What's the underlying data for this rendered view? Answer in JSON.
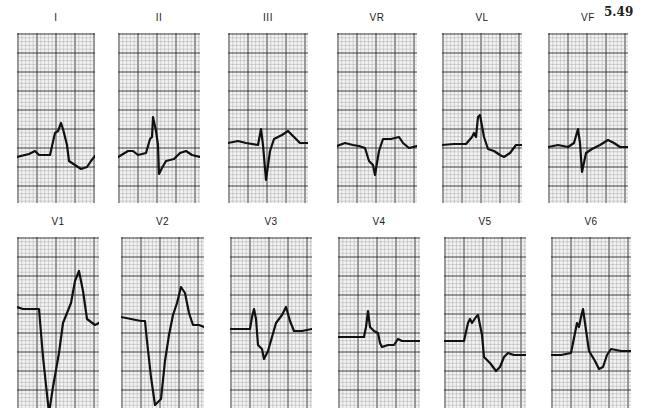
{
  "figure_number": "5.49",
  "grid": {
    "paper_color": "#f3f3f3",
    "minor_color": "#9a9a9a",
    "major_color": "#2a2a2a",
    "trace_color": "#111111"
  },
  "leads": [
    {
      "label": "I",
      "x": 17,
      "y": 12,
      "w": 78,
      "h": 170,
      "path": "M0,124 L12,121 L18,118 L22,122 L33,122 L38,100 L41,98 L44,90 L46,96 L50,112 L52,128 L58,132 L64,136 L70,134 L74,128 L78,123"
    },
    {
      "label": "II",
      "x": 118,
      "y": 12,
      "w": 82,
      "h": 170,
      "path": "M0,124 L10,118 L15,118 L20,122 L28,120 L32,106 L34,104 L35,84 L38,98 L40,112 L41,141 L44,135 L48,128 L56,126 L62,120 L68,118 L74,122 L82,124"
    },
    {
      "label": "III",
      "x": 228,
      "y": 12,
      "w": 80,
      "h": 170,
      "path": "M0,110 L10,108 L18,110 L30,112 L33,96 L35,112 L38,147 L42,118 L46,106 L54,102 L60,98 L66,104 L72,110 L80,110"
    },
    {
      "label": "VR",
      "x": 337,
      "y": 12,
      "w": 80,
      "h": 170,
      "path": "M0,113 L8,110 L16,112 L22,113 L28,115 L32,128 L36,132 L38,142 L42,118 L46,106 L54,106 L62,104 L66,110 L72,115 L80,113"
    },
    {
      "label": "VL",
      "x": 442,
      "y": 12,
      "w": 80,
      "h": 170,
      "path": "M0,112 L12,111 L24,111 L30,104 L32,100 L34,104 L36,84 L38,82 L42,104 L46,116 L52,118 L58,122 L62,124 L68,120 L74,112 L80,112"
    },
    {
      "label": "VF",
      "x": 548,
      "y": 12,
      "w": 80,
      "h": 170,
      "path": "M0,114 L10,112 L20,114 L26,110 L30,96 L32,110 L34,139 L38,120 L44,116 L52,112 L60,107 L66,110 L72,114 L80,114"
    },
    {
      "label": "V1",
      "x": 17,
      "y": 216,
      "w": 82,
      "h": 171,
      "path": "M0,70 L6,72 L18,72 L22,72 L26,120 L32,176 L36,150 L42,116 L46,86 L50,76 L54,66 L58,44 L62,34 L66,54 L70,82 L78,88 L82,86"
    },
    {
      "label": "V2",
      "x": 121,
      "y": 216,
      "w": 83,
      "h": 171,
      "path": "M0,80 L10,82 L20,84 L24,84 L26,104 L30,140 L34,168 L40,162 L44,124 L48,98 L52,78 L56,66 L60,50 L64,56 L68,76 L72,88 L78,88 L83,90"
    },
    {
      "label": "V3",
      "x": 230,
      "y": 216,
      "w": 82,
      "h": 171,
      "path": "M0,92 L10,92 L20,92 L22,80 L24,72 L26,82 L28,108 L32,112 L34,122 L38,114 L42,100 L46,86 L52,78 L56,70 L60,84 L64,94 L72,94 L82,92"
    },
    {
      "label": "V4",
      "x": 338,
      "y": 216,
      "w": 82,
      "h": 171,
      "path": "M0,100 L10,100 L26,100 L28,90 L30,74 L32,90 L36,94 L40,96 L42,106 L44,110 L50,108 L56,108 L60,102 L64,104 L70,104 L82,104"
    },
    {
      "label": "V5",
      "x": 444,
      "y": 216,
      "w": 82,
      "h": 171,
      "path": "M0,104 L10,104 L20,104 L24,86 L26,82 L28,86 L32,80 L34,78 L38,98 L40,120 L46,126 L52,134 L56,130 L60,120 L64,116 L70,118 L82,118"
    },
    {
      "label": "V6",
      "x": 551,
      "y": 216,
      "w": 80,
      "h": 171,
      "path": "M0,118 L10,118 L20,116 L24,96 L26,86 L28,90 L30,80 L32,72 L34,86 L38,114 L44,124 L48,132 L52,130 L56,118 L60,112 L70,114 L80,114"
    }
  ]
}
